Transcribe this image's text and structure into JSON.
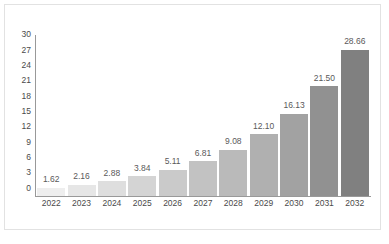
{
  "chart_data": {
    "type": "bar",
    "title": "",
    "subtitle": "",
    "xlabel": "",
    "ylabel": "",
    "categories": [
      "2022",
      "2023",
      "2024",
      "2025",
      "2026",
      "2027",
      "2028",
      "2029",
      "2030",
      "2031",
      "2032"
    ],
    "values": [
      1.62,
      2.16,
      2.88,
      3.84,
      5.11,
      6.81,
      9.08,
      12.1,
      16.13,
      21.5,
      28.66
    ],
    "value_labels": [
      "1.62",
      "2.16",
      "2.88",
      "3.84",
      "5.11",
      "6.81",
      "9.08",
      "12.10",
      "16.13",
      "21.50",
      "28.66"
    ],
    "yticks": [
      0,
      3,
      6,
      9,
      12,
      15,
      18,
      21,
      24,
      27,
      30
    ],
    "ytick_labels": [
      "0",
      "3",
      "6",
      "9",
      "12",
      "15",
      "18",
      "21",
      "24",
      "27",
      "30"
    ],
    "ylim": [
      0,
      31.5
    ],
    "grid": false,
    "legend": null,
    "legend_position": "none",
    "bar_colors": [
      "#eeeeee",
      "#e6e6e6",
      "#dedede",
      "#d4d4d4",
      "#cacaca",
      "#c2c2c2",
      "#bababa",
      "#b0b0b0",
      "#a2a2a2",
      "#919191",
      "#808080"
    ]
  },
  "style": {
    "axis_color": "#999999",
    "tick_text_color": "#4a4a4a",
    "value_text_color": "#5a5a5a",
    "frame_border_color": "#e2e2e2",
    "background": "#ffffff"
  },
  "watermark": {
    "text": "",
    "color": "#f2f2f2"
  }
}
